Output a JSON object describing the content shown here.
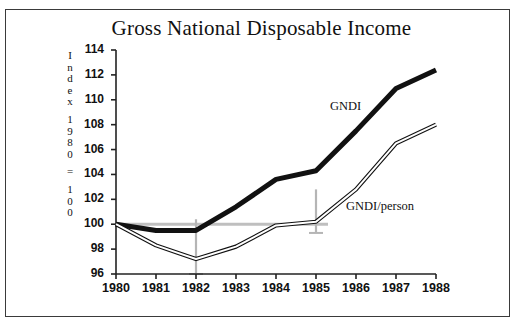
{
  "figure": {
    "title": "Gross National Disposable Income",
    "y_axis_caption_lines": [
      "I",
      "n",
      "d",
      "e",
      "x",
      "",
      "1",
      "9",
      "8",
      "0",
      "",
      "=",
      "",
      "1",
      "0",
      "0"
    ],
    "y_axis_caption_text": "Index 1980 = 100",
    "border_color": "#3a3a3a",
    "background_color": "#ffffff"
  },
  "chart_data": {
    "type": "line",
    "title": "Gross National Disposable Income",
    "xlabel": "",
    "ylabel": "Index 1980 = 100",
    "x": [
      1980,
      1981,
      1982,
      1983,
      1984,
      1985,
      1986,
      1987,
      1988
    ],
    "categories": [
      "1980",
      "1981",
      "1982",
      "1983",
      "1984",
      "1985",
      "1986",
      "1987",
      "1988"
    ],
    "xlim": [
      1980,
      1988
    ],
    "ylim": [
      96,
      114
    ],
    "yticks": [
      96,
      98,
      100,
      102,
      104,
      106,
      108,
      110,
      112,
      114
    ],
    "xticks": [
      "1980",
      "1981",
      "1982",
      "1983",
      "1984",
      "1985",
      "1986",
      "1987",
      "1988"
    ],
    "grid": false,
    "legend_position": "inline-annotation",
    "series": [
      {
        "name": "GNDI",
        "label": "GNDI",
        "color": "#111111",
        "style": "thick-solid",
        "values": [
          100.0,
          99.5,
          99.5,
          101.4,
          103.6,
          104.3,
          107.5,
          110.9,
          112.4
        ]
      },
      {
        "name": "GNDI/person",
        "label": "GNDI/person",
        "color": "#111111",
        "style": "thin-double",
        "values": [
          100.0,
          98.3,
          97.2,
          98.2,
          99.9,
          100.2,
          102.8,
          106.5,
          108.0
        ]
      }
    ],
    "annotations": [
      {
        "name": "reference-line-100",
        "type": "horizontal-line",
        "value": 100,
        "color": "#bfbfbf",
        "x_from": 1980,
        "x_to": 1985.3
      },
      {
        "name": "marker-1982",
        "type": "vertical-line",
        "x": 1982,
        "y_from": 96,
        "y_to": 100.4,
        "color": "#b5b5b5"
      },
      {
        "name": "marker-1985",
        "type": "vertical-line",
        "x": 1985,
        "y_from": 99.3,
        "y_to": 102.8,
        "color": "#b5b5b5"
      }
    ]
  }
}
